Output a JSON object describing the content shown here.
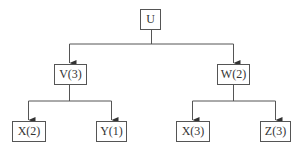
{
  "diagram": {
    "type": "tree",
    "root": {
      "label": "U"
    },
    "level1": [
      {
        "label": "V(3)"
      },
      {
        "label": "W(2)"
      }
    ],
    "level2": [
      {
        "label": "X(2)",
        "parent": "V(3)"
      },
      {
        "label": "Y(1)",
        "parent": "V(3)"
      },
      {
        "label": "X(3)",
        "parent": "W(2)"
      },
      {
        "label": "Z(3)",
        "parent": "W(2)"
      }
    ],
    "colors": {
      "line": "#555555",
      "text": "#333333",
      "background": "#ffffff"
    }
  }
}
